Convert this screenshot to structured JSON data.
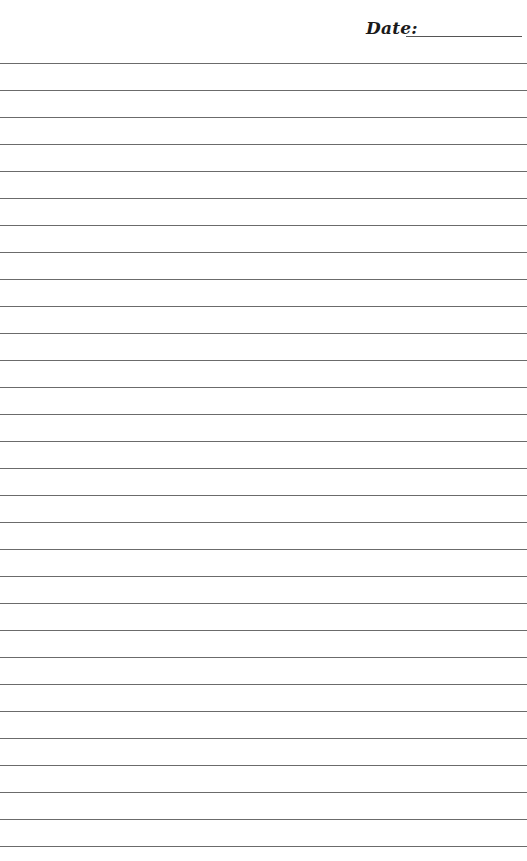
{
  "header": {
    "date_label": "Date:",
    "date_value": ""
  },
  "page": {
    "line_count": 30,
    "first_line_y": 63,
    "line_spacing": 27,
    "line_color": "#6b6b6b",
    "background": "#ffffff"
  }
}
